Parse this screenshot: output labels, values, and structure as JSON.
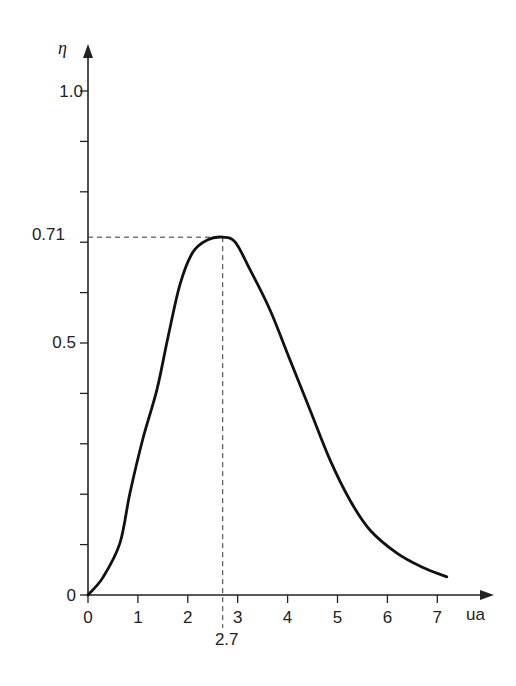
{
  "chart_data": {
    "type": "line",
    "title": "",
    "xlabel": "ua",
    "ylabel": "η",
    "xlim": [
      0,
      7.6
    ],
    "ylim": [
      0,
      1.05
    ],
    "grid": false,
    "legend": null,
    "x_ticks": [
      0,
      1,
      2,
      3,
      4,
      5,
      6,
      7
    ],
    "x_tick_labels": [
      "0",
      "1",
      "2",
      "3",
      "4",
      "5",
      "6",
      "7"
    ],
    "y_major_ticks": [
      0,
      0.5,
      1.0
    ],
    "y_tick_labels": [
      "0",
      "0.5",
      "1.0"
    ],
    "y_minor_ticks": [
      0.1,
      0.2,
      0.3,
      0.4,
      0.6,
      0.7,
      0.8,
      0.9
    ],
    "annotations": [
      {
        "type": "peak-marker",
        "x": 2.7,
        "y": 0.71,
        "x_label": "2.7",
        "y_label": "0.71",
        "style": "dashed"
      }
    ],
    "series": [
      {
        "name": "η(ua)",
        "x": [
          0,
          0.3,
          0.64,
          0.84,
          1.1,
          1.38,
          1.6,
          1.84,
          2.1,
          2.4,
          2.7,
          2.95,
          3.25,
          3.65,
          4.05,
          4.45,
          4.85,
          5.25,
          5.65,
          6.19,
          6.7,
          7.19
        ],
        "y": [
          0,
          0.035,
          0.103,
          0.202,
          0.31,
          0.407,
          0.51,
          0.615,
          0.68,
          0.705,
          0.71,
          0.7,
          0.645,
          0.565,
          0.466,
          0.367,
          0.268,
          0.188,
          0.129,
          0.083,
          0.055,
          0.036
        ]
      }
    ]
  },
  "labels": {
    "y_axis": "η",
    "x_axis": "ua",
    "y_1_0": "1.0",
    "y_0_71": "0.71",
    "y_0_5": "0.5",
    "y_0": "0",
    "x_2_7": "2.7"
  }
}
